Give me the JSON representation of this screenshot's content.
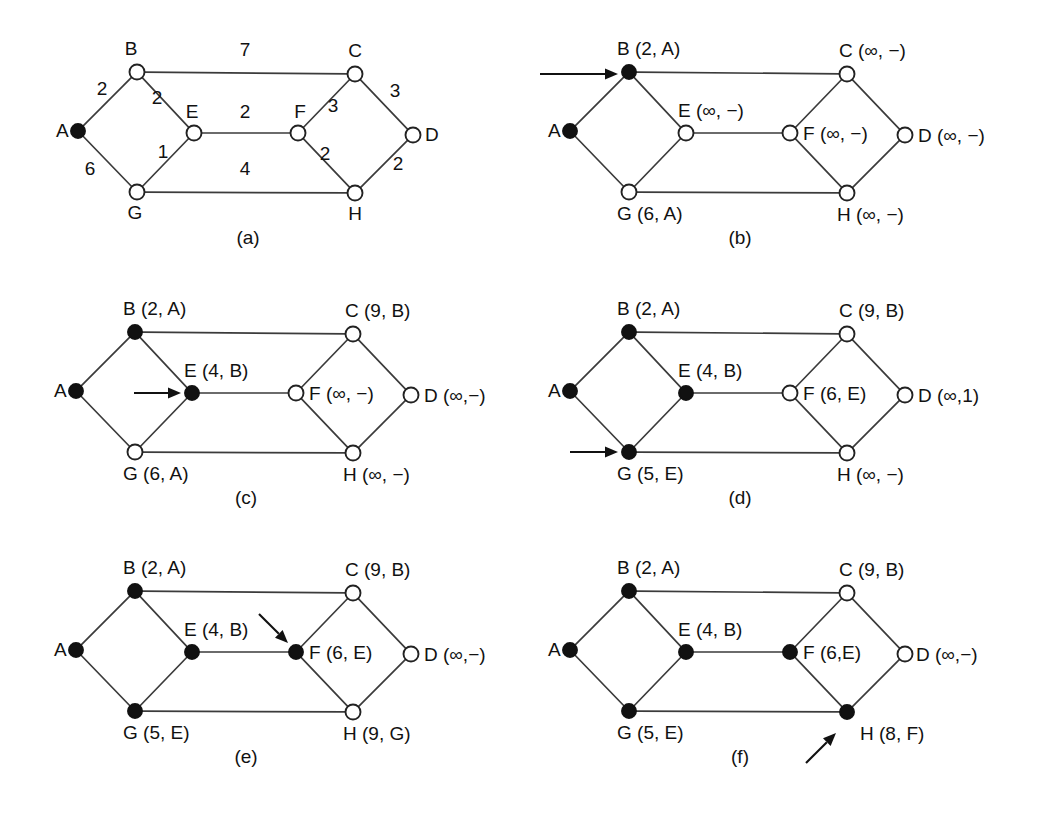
{
  "figure": {
    "background_color": "#ffffff",
    "ink_color": "#111111",
    "node_radius": 7.5,
    "node_radius_filled": 7.0
  },
  "geometry": {
    "node_offsets": {
      "A": {
        "dx": 0,
        "dy": 0
      },
      "B": {
        "dx": 59,
        "dy": -59
      },
      "E": {
        "dx": 116,
        "dy": 2
      },
      "C": {
        "dx": 277,
        "dy": -57
      },
      "F": {
        "dx": 220,
        "dy": 2
      },
      "D": {
        "dx": 335,
        "dy": 4
      },
      "G": {
        "dx": 59,
        "dy": 61
      },
      "H": {
        "dx": 277,
        "dy": 62
      }
    },
    "edges": [
      {
        "from": "A",
        "to": "B"
      },
      {
        "from": "A",
        "to": "G"
      },
      {
        "from": "B",
        "to": "E"
      },
      {
        "from": "B",
        "to": "C"
      },
      {
        "from": "E",
        "to": "G"
      },
      {
        "from": "E",
        "to": "F"
      },
      {
        "from": "G",
        "to": "H"
      },
      {
        "from": "C",
        "to": "F"
      },
      {
        "from": "C",
        "to": "D"
      },
      {
        "from": "F",
        "to": "H"
      },
      {
        "from": "H",
        "to": "D"
      }
    ]
  },
  "panels": [
    {
      "id": "panel-a",
      "caption": "(a)",
      "origin": {
        "x": 78,
        "y": 131
      },
      "caption_pos": {
        "x": 248,
        "y": 244
      },
      "filled_nodes": [
        "A"
      ],
      "labels": [
        {
          "node": "A",
          "text": "A",
          "dx": -22,
          "dy": 6,
          "anchor": "start"
        },
        {
          "node": "B",
          "text": "B",
          "dx": -6,
          "dy": -17,
          "anchor": "middle"
        },
        {
          "node": "E",
          "text": "E",
          "dx": -2,
          "dy": -15,
          "anchor": "middle"
        },
        {
          "node": "C",
          "text": "C",
          "dx": 0,
          "dy": -17,
          "anchor": "middle"
        },
        {
          "node": "F",
          "text": "F",
          "dx": 2,
          "dy": -15,
          "anchor": "middle"
        },
        {
          "node": "D",
          "text": "D",
          "dx": 12,
          "dy": 6,
          "anchor": "start"
        },
        {
          "node": "G",
          "text": "G",
          "dx": -2,
          "dy": 27,
          "anchor": "middle"
        },
        {
          "node": "H",
          "text": "H",
          "dx": 0,
          "dy": 27,
          "anchor": "middle"
        }
      ],
      "weights": [
        {
          "text": "2",
          "x": 102,
          "y": 95
        },
        {
          "text": "7",
          "x": 245,
          "y": 56
        },
        {
          "text": "2",
          "x": 157,
          "y": 104
        },
        {
          "text": "2",
          "x": 245,
          "y": 118
        },
        {
          "text": "3",
          "x": 333,
          "y": 112
        },
        {
          "text": "3",
          "x": 395,
          "y": 97
        },
        {
          "text": "6",
          "x": 90,
          "y": 175
        },
        {
          "text": "1",
          "x": 163,
          "y": 158
        },
        {
          "text": "4",
          "x": 245,
          "y": 175
        },
        {
          "text": "2",
          "x": 325,
          "y": 160
        },
        {
          "text": "2",
          "x": 398,
          "y": 170
        }
      ],
      "arrow": null
    },
    {
      "id": "panel-b",
      "caption": "(b)",
      "origin": {
        "x": 570,
        "y": 131
      },
      "caption_pos": {
        "x": 740,
        "y": 244
      },
      "filled_nodes": [
        "A",
        "B"
      ],
      "labels": [
        {
          "node": "A",
          "text": "A",
          "dx": -22,
          "dy": 6,
          "anchor": "start"
        },
        {
          "node": "B",
          "text": "B (2, A)",
          "dx": -12,
          "dy": -17,
          "anchor": "start"
        },
        {
          "node": "E",
          "text": "E (∞, −)",
          "dx": -8,
          "dy": -16,
          "anchor": "start"
        },
        {
          "node": "C",
          "text": "C (∞, −)",
          "dx": -8,
          "dy": -17,
          "anchor": "start"
        },
        {
          "node": "F",
          "text": "F (∞, −)",
          "dx": 13,
          "dy": 7,
          "anchor": "start"
        },
        {
          "node": "D",
          "text": "D (∞, −)",
          "dx": 13,
          "dy": 7,
          "anchor": "start"
        },
        {
          "node": "G",
          "text": "G (6, A)",
          "dx": -12,
          "dy": 28,
          "anchor": "start"
        },
        {
          "node": "H",
          "text": "H (∞, −)",
          "dx": -10,
          "dy": 28,
          "anchor": "start"
        }
      ],
      "weights": [],
      "arrow": {
        "x1": 540,
        "y1": 74,
        "x2": 618,
        "y2": 74
      }
    },
    {
      "id": "panel-c",
      "caption": "(c)",
      "origin": {
        "x": 76,
        "y": 391
      },
      "caption_pos": {
        "x": 246,
        "y": 504
      },
      "filled_nodes": [
        "A",
        "B",
        "E"
      ],
      "labels": [
        {
          "node": "A",
          "text": "A",
          "dx": -22,
          "dy": 6,
          "anchor": "start"
        },
        {
          "node": "B",
          "text": "B (2, A)",
          "dx": -12,
          "dy": -17,
          "anchor": "start"
        },
        {
          "node": "E",
          "text": "E (4, B)",
          "dx": -8,
          "dy": -16,
          "anchor": "start"
        },
        {
          "node": "C",
          "text": "C (9, B)",
          "dx": -8,
          "dy": -17,
          "anchor": "start"
        },
        {
          "node": "F",
          "text": "F (∞, −)",
          "dx": 13,
          "dy": 7,
          "anchor": "start"
        },
        {
          "node": "D",
          "text": "D (∞,−)",
          "dx": 13,
          "dy": 7,
          "anchor": "start"
        },
        {
          "node": "G",
          "text": "G (6, A)",
          "dx": -12,
          "dy": 28,
          "anchor": "start"
        },
        {
          "node": "H",
          "text": "H (∞, −)",
          "dx": -10,
          "dy": 28,
          "anchor": "start"
        }
      ],
      "weights": [],
      "arrow": {
        "x1": 134,
        "y1": 393,
        "x2": 181,
        "y2": 393
      }
    },
    {
      "id": "panel-d",
      "caption": "(d)",
      "origin": {
        "x": 570,
        "y": 391
      },
      "caption_pos": {
        "x": 740,
        "y": 504
      },
      "filled_nodes": [
        "A",
        "B",
        "E",
        "G"
      ],
      "labels": [
        {
          "node": "A",
          "text": "A",
          "dx": -22,
          "dy": 6,
          "anchor": "start"
        },
        {
          "node": "B",
          "text": "B (2, A)",
          "dx": -12,
          "dy": -17,
          "anchor": "start"
        },
        {
          "node": "E",
          "text": "E (4, B)",
          "dx": -8,
          "dy": -16,
          "anchor": "start"
        },
        {
          "node": "C",
          "text": "C (9, B)",
          "dx": -8,
          "dy": -17,
          "anchor": "start"
        },
        {
          "node": "F",
          "text": "F (6, E)",
          "dx": 13,
          "dy": 7,
          "anchor": "start"
        },
        {
          "node": "D",
          "text": "D (∞,1)",
          "dx": 13,
          "dy": 7,
          "anchor": "start"
        },
        {
          "node": "G",
          "text": "G (5, E)",
          "dx": -12,
          "dy": 28,
          "anchor": "start"
        },
        {
          "node": "H",
          "text": "H (∞, −)",
          "dx": -10,
          "dy": 28,
          "anchor": "start"
        }
      ],
      "weights": [],
      "arrow": {
        "x1": 570,
        "y1": 452,
        "x2": 618,
        "y2": 452
      }
    },
    {
      "id": "panel-e",
      "caption": "(e)",
      "origin": {
        "x": 76,
        "y": 650
      },
      "caption_pos": {
        "x": 246,
        "y": 763
      },
      "filled_nodes": [
        "A",
        "B",
        "E",
        "G",
        "F"
      ],
      "labels": [
        {
          "node": "A",
          "text": "A",
          "dx": -22,
          "dy": 6,
          "anchor": "start"
        },
        {
          "node": "B",
          "text": "B (2, A)",
          "dx": -12,
          "dy": -17,
          "anchor": "start"
        },
        {
          "node": "E",
          "text": "E (4, B)",
          "dx": -8,
          "dy": -16,
          "anchor": "start"
        },
        {
          "node": "C",
          "text": "C (9, B)",
          "dx": -8,
          "dy": -17,
          "anchor": "start"
        },
        {
          "node": "F",
          "text": "F (6, E)",
          "dx": 13,
          "dy": 7,
          "anchor": "start"
        },
        {
          "node": "D",
          "text": "D (∞,−)",
          "dx": 13,
          "dy": 7,
          "anchor": "start"
        },
        {
          "node": "G",
          "text": "G (5, E)",
          "dx": -12,
          "dy": 28,
          "anchor": "start"
        },
        {
          "node": "H",
          "text": "H (9, G)",
          "dx": -10,
          "dy": 28,
          "anchor": "start"
        }
      ],
      "weights": [],
      "arrow": {
        "x1": 259,
        "y1": 614,
        "x2": 288,
        "y2": 643
      }
    },
    {
      "id": "panel-f",
      "caption": "(f)",
      "origin": {
        "x": 570,
        "y": 650
      },
      "caption_pos": {
        "x": 740,
        "y": 763
      },
      "filled_nodes": [
        "A",
        "B",
        "E",
        "G",
        "F",
        "H"
      ],
      "labels": [
        {
          "node": "A",
          "text": "A",
          "dx": -22,
          "dy": 6,
          "anchor": "start"
        },
        {
          "node": "B",
          "text": "B (2, A)",
          "dx": -12,
          "dy": -17,
          "anchor": "start"
        },
        {
          "node": "E",
          "text": "E (4, B)",
          "dx": -8,
          "dy": -16,
          "anchor": "start"
        },
        {
          "node": "C",
          "text": "C (9, B)",
          "dx": -8,
          "dy": -17,
          "anchor": "start"
        },
        {
          "node": "F",
          "text": "F (6,E)",
          "dx": 13,
          "dy": 7,
          "anchor": "start"
        },
        {
          "node": "D",
          "text": "D (∞,−)",
          "dx": 11,
          "dy": 7,
          "anchor": "start"
        },
        {
          "node": "G",
          "text": "G (5, E)",
          "dx": -12,
          "dy": 28,
          "anchor": "start"
        },
        {
          "node": "H",
          "text": "H (8, F)",
          "dx": 13,
          "dy": 28,
          "anchor": "start"
        }
      ],
      "weights": [],
      "arrow": {
        "x1": 806,
        "y1": 763,
        "x2": 836,
        "y2": 733
      }
    }
  ],
  "graph_data": {
    "type": "diagram",
    "subtype": "weighted-undirected-graph",
    "nodes": [
      "A",
      "B",
      "C",
      "D",
      "E",
      "F",
      "G",
      "H"
    ],
    "edges": [
      {
        "u": "A",
        "v": "B",
        "weight": 2
      },
      {
        "u": "A",
        "v": "G",
        "weight": 6
      },
      {
        "u": "B",
        "v": "C",
        "weight": 7
      },
      {
        "u": "B",
        "v": "E",
        "weight": 2
      },
      {
        "u": "E",
        "v": "G",
        "weight": 1
      },
      {
        "u": "E",
        "v": "F",
        "weight": 2
      },
      {
        "u": "G",
        "v": "H",
        "weight": 4
      },
      {
        "u": "C",
        "v": "F",
        "weight": 3
      },
      {
        "u": "C",
        "v": "D",
        "weight": 3
      },
      {
        "u": "F",
        "v": "H",
        "weight": 2
      },
      {
        "u": "H",
        "v": "D",
        "weight": 2
      }
    ],
    "steps": [
      {
        "panel": "(a)",
        "description": "Initial weighted graph; A is the source (filled).",
        "working_node": "A",
        "permanent": [
          "A"
        ],
        "tentative": {}
      },
      {
        "panel": "(b)",
        "description": "B made permanent; neighbours of A labelled.",
        "working_node": "B",
        "permanent": [
          "A",
          "B"
        ],
        "tentative": {
          "B": {
            "dist": "2",
            "pred": "A"
          },
          "C": {
            "dist": "∞",
            "pred": "−"
          },
          "D": {
            "dist": "∞",
            "pred": "−"
          },
          "E": {
            "dist": "∞",
            "pred": "−"
          },
          "F": {
            "dist": "∞",
            "pred": "−"
          },
          "G": {
            "dist": "6",
            "pred": "A"
          },
          "H": {
            "dist": "∞",
            "pred": "−"
          }
        }
      },
      {
        "panel": "(c)",
        "description": "E made permanent via B; C relabelled (9, B).",
        "working_node": "E",
        "permanent": [
          "A",
          "B",
          "E"
        ],
        "tentative": {
          "B": {
            "dist": "2",
            "pred": "A"
          },
          "C": {
            "dist": "9",
            "pred": "B"
          },
          "D": {
            "dist": "∞",
            "pred": "−"
          },
          "E": {
            "dist": "4",
            "pred": "B"
          },
          "F": {
            "dist": "∞",
            "pred": "−"
          },
          "G": {
            "dist": "6",
            "pred": "A"
          },
          "H": {
            "dist": "∞",
            "pred": "−"
          }
        }
      },
      {
        "panel": "(d)",
        "description": "G made permanent via E; F relabelled (6, E), G improved to (5, E).",
        "working_node": "G",
        "permanent": [
          "A",
          "B",
          "E",
          "G"
        ],
        "tentative": {
          "B": {
            "dist": "2",
            "pred": "A"
          },
          "C": {
            "dist": "9",
            "pred": "B"
          },
          "D": {
            "dist": "∞",
            "pred": "1"
          },
          "E": {
            "dist": "4",
            "pred": "B"
          },
          "F": {
            "dist": "6",
            "pred": "E"
          },
          "G": {
            "dist": "5",
            "pred": "E"
          },
          "H": {
            "dist": "∞",
            "pred": "−"
          }
        }
      },
      {
        "panel": "(e)",
        "description": "F made permanent; H labelled (9, G) from G.",
        "working_node": "F",
        "permanent": [
          "A",
          "B",
          "E",
          "G",
          "F"
        ],
        "tentative": {
          "B": {
            "dist": "2",
            "pred": "A"
          },
          "C": {
            "dist": "9",
            "pred": "B"
          },
          "D": {
            "dist": "∞",
            "pred": "−"
          },
          "E": {
            "dist": "4",
            "pred": "B"
          },
          "F": {
            "dist": "6",
            "pred": "E"
          },
          "G": {
            "dist": "5",
            "pred": "E"
          },
          "H": {
            "dist": "9",
            "pred": "G"
          }
        }
      },
      {
        "panel": "(f)",
        "description": "H made permanent and improved to (8, F) through F.",
        "working_node": "H",
        "permanent": [
          "A",
          "B",
          "E",
          "G",
          "F",
          "H"
        ],
        "tentative": {
          "B": {
            "dist": "2",
            "pred": "A"
          },
          "C": {
            "dist": "9",
            "pred": "B"
          },
          "D": {
            "dist": "∞",
            "pred": "−"
          },
          "E": {
            "dist": "4",
            "pred": "B"
          },
          "F": {
            "dist": "6",
            "pred": "E"
          },
          "G": {
            "dist": "5",
            "pred": "E"
          },
          "H": {
            "dist": "8",
            "pred": "F"
          }
        }
      }
    ]
  }
}
